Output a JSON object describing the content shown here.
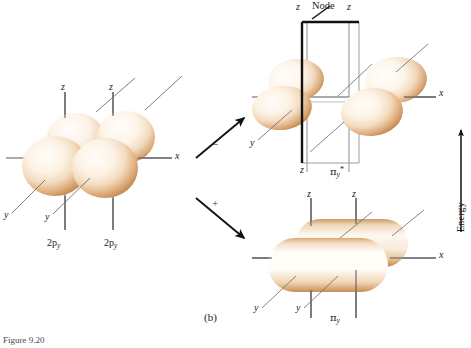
{
  "figure": {
    "panel_label": "(b)",
    "caption": "Figure 9.20",
    "energy_axis_label": "Energy",
    "node_label": "Node"
  },
  "palette": {
    "lobe_core": "#fffaf2",
    "lobe_mid": "#f0d5b4",
    "lobe_edge": "#d39a63",
    "lobe_rim": "#b97c45",
    "axis_line": "#58595b",
    "leader_line": "#6e6f71",
    "node_edge_strong": "#111111",
    "node_edge_thin": "#8d8e90",
    "arrow": "#111111",
    "text": "#1b1b1b",
    "background": "#ffffff"
  },
  "reactant_panel": {
    "name": "two-2p-orbitals",
    "axis_labels": {
      "x": "x",
      "z_left": "z",
      "z_right": "z",
      "y_far_left": "y",
      "y_left": "y"
    },
    "orbital_labels": [
      "2p",
      "2p"
    ],
    "orbital_subscripts": [
      "y",
      "y"
    ],
    "lobe_count": 4
  },
  "transitions": [
    {
      "name": "antibonding-combination",
      "sign": "−",
      "direction": "up-right",
      "target": "pi-y-antibonding"
    },
    {
      "name": "bonding-combination",
      "sign": "+",
      "direction": "down-right",
      "target": "pi-y-bonding"
    }
  ],
  "antibonding_panel": {
    "name": "pi-y-antibonding",
    "orbital_label_base": "π",
    "orbital_label_sub": "y",
    "orbital_label_sup": "*",
    "node_label": "Node",
    "axis_labels": {
      "x": "x",
      "z_left": "z",
      "z_right": "z",
      "z_bottom_left": "z",
      "y_left": "y"
    },
    "lobe_count": 4,
    "has_node_plane": true
  },
  "bonding_panel": {
    "name": "pi-y-bonding",
    "orbital_label_base": "π",
    "orbital_label_sub": "y",
    "axis_labels": {
      "x": "x",
      "z_left": "z",
      "z_right": "z",
      "y_far_left": "y",
      "y_left": "y"
    },
    "lobe_count": 2,
    "has_node_plane": false
  }
}
